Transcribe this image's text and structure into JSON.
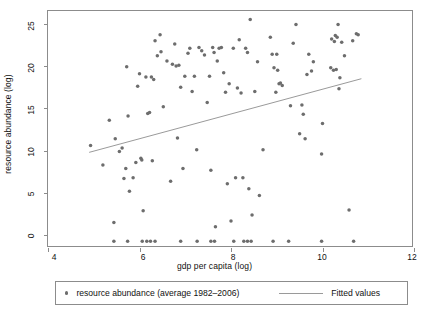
{
  "chart_data": {
    "type": "scatter",
    "title": "",
    "xlabel": "gdp per capita (log)",
    "ylabel": "resource abundance (log)",
    "xlim": [
      4,
      12
    ],
    "ylim": [
      -1.5,
      26.5
    ],
    "xticks": [
      4,
      6,
      8,
      10,
      12
    ],
    "xtick_labels": [
      "4",
      "6",
      "8",
      "10",
      "12"
    ],
    "yticks": [
      0,
      5,
      10,
      15,
      20,
      25
    ],
    "ytick_labels": [
      "0",
      "5",
      "10",
      "15",
      "20",
      "25"
    ],
    "grid": false,
    "legend_position": "below",
    "marker_color": "#6d6d6d",
    "line_color": "#9a9a9a",
    "frame_color": "#8c8c8c",
    "series": [
      {
        "name": "resource abundance (average 1982-2006)",
        "type": "scatter",
        "points": [
          [
            4.93,
            10.6
          ],
          [
            5.2,
            8.3
          ],
          [
            5.34,
            13.6
          ],
          [
            5.44,
            1.5
          ],
          [
            5.47,
            11.4
          ],
          [
            5.56,
            9.9
          ],
          [
            5.62,
            10.3
          ],
          [
            5.66,
            6.7
          ],
          [
            5.7,
            7.9
          ],
          [
            5.72,
            19.9
          ],
          [
            5.75,
            14.1
          ],
          [
            5.78,
            5.2
          ],
          [
            5.86,
            6.8
          ],
          [
            5.92,
            8.6
          ],
          [
            5.96,
            17.6
          ],
          [
            6.0,
            19.1
          ],
          [
            6.03,
            9.1
          ],
          [
            6.05,
            8.9
          ],
          [
            6.08,
            2.9
          ],
          [
            6.14,
            18.7
          ],
          [
            6.18,
            14.4
          ],
          [
            6.22,
            14.5
          ],
          [
            6.26,
            18.7
          ],
          [
            6.28,
            8.8
          ],
          [
            6.31,
            18.4
          ],
          [
            6.34,
            23.0
          ],
          [
            6.39,
            21.2
          ],
          [
            6.45,
            23.7
          ],
          [
            6.47,
            21.7
          ],
          [
            6.52,
            15.2
          ],
          [
            6.6,
            20.6
          ],
          [
            6.68,
            6.4
          ],
          [
            6.72,
            20.2
          ],
          [
            6.77,
            22.6
          ],
          [
            6.8,
            20.0
          ],
          [
            6.83,
            11.5
          ],
          [
            6.86,
            20.1
          ],
          [
            6.9,
            17.5
          ],
          [
            6.95,
            7.9
          ],
          [
            6.99,
            18.8
          ],
          [
            7.06,
            21.5
          ],
          [
            7.1,
            22.1
          ],
          [
            7.15,
            17.0
          ],
          [
            7.2,
            18.8
          ],
          [
            7.25,
            10.1
          ],
          [
            7.3,
            22.2
          ],
          [
            7.36,
            21.8
          ],
          [
            7.42,
            21.3
          ],
          [
            7.48,
            15.7
          ],
          [
            7.53,
            18.8
          ],
          [
            7.56,
            7.7
          ],
          [
            7.6,
            22.2
          ],
          [
            7.63,
            21.6
          ],
          [
            7.66,
            1.0
          ],
          [
            7.7,
            20.6
          ],
          [
            7.74,
            22.1
          ],
          [
            7.79,
            22.2
          ],
          [
            7.84,
            19.2
          ],
          [
            7.88,
            16.9
          ],
          [
            7.92,
            6.1
          ],
          [
            7.96,
            17.9
          ],
          [
            8.0,
            1.7
          ],
          [
            8.05,
            22.1
          ],
          [
            8.1,
            6.8
          ],
          [
            8.14,
            17.4
          ],
          [
            8.18,
            23.1
          ],
          [
            8.22,
            16.8
          ],
          [
            8.26,
            6.8
          ],
          [
            8.32,
            22.1
          ],
          [
            8.36,
            21.6
          ],
          [
            8.39,
            5.5
          ],
          [
            8.42,
            25.5
          ],
          [
            8.46,
            2.4
          ],
          [
            8.52,
            17.0
          ],
          [
            8.58,
            20.5
          ],
          [
            8.62,
            4.7
          ],
          [
            8.7,
            10.1
          ],
          [
            8.86,
            23.4
          ],
          [
            8.9,
            21.4
          ],
          [
            8.94,
            19.8
          ],
          [
            8.98,
            16.9
          ],
          [
            9.0,
            21.4
          ],
          [
            9.02,
            19.5
          ],
          [
            9.05,
            17.9
          ],
          [
            9.08,
            18.0
          ],
          [
            9.12,
            17.7
          ],
          [
            9.3,
            15.3
          ],
          [
            9.36,
            22.7
          ],
          [
            9.42,
            24.9
          ],
          [
            9.5,
            12.0
          ],
          [
            9.55,
            15.4
          ],
          [
            9.58,
            14.3
          ],
          [
            9.62,
            11.4
          ],
          [
            9.66,
            19.0
          ],
          [
            9.7,
            21.4
          ],
          [
            9.76,
            19.4
          ],
          [
            9.8,
            20.5
          ],
          [
            9.98,
            9.6
          ],
          [
            10.0,
            13.2
          ],
          [
            10.18,
            19.8
          ],
          [
            10.2,
            23.2
          ],
          [
            10.24,
            19.5
          ],
          [
            10.26,
            22.9
          ],
          [
            10.28,
            23.6
          ],
          [
            10.3,
            19.6
          ],
          [
            10.32,
            23.4
          ],
          [
            10.34,
            24.9
          ],
          [
            10.36,
            17.3
          ],
          [
            10.38,
            18.6
          ],
          [
            10.42,
            22.8
          ],
          [
            10.48,
            21.2
          ],
          [
            10.58,
            3.0
          ],
          [
            10.66,
            23.0
          ],
          [
            10.74,
            23.8
          ],
          [
            10.78,
            23.7
          ],
          [
            5.44,
            -0.7
          ],
          [
            5.74,
            -0.7
          ],
          [
            6.06,
            -0.7
          ],
          [
            6.16,
            -0.7
          ],
          [
            6.24,
            -0.7
          ],
          [
            6.34,
            -0.7
          ],
          [
            6.9,
            -0.7
          ],
          [
            7.26,
            -0.7
          ],
          [
            7.56,
            -0.7
          ],
          [
            7.64,
            -0.7
          ],
          [
            8.06,
            -0.7
          ],
          [
            8.28,
            -0.7
          ],
          [
            8.36,
            -0.7
          ],
          [
            8.44,
            -0.7
          ],
          [
            8.92,
            -0.7
          ],
          [
            9.26,
            -0.7
          ],
          [
            9.98,
            -0.7
          ],
          [
            10.68,
            -0.7
          ]
        ]
      },
      {
        "name": "Fitted values",
        "type": "line",
        "x": [
          4.9,
          10.85
        ],
        "y": [
          9.8,
          18.5
        ]
      }
    ]
  },
  "legend": {
    "entries": [
      {
        "label": "resource abundance (average 1982–2006)",
        "marker": "dot"
      },
      {
        "label": "Fitted values",
        "marker": "line"
      }
    ]
  }
}
